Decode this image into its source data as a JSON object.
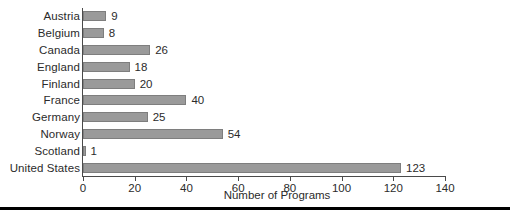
{
  "chart_data": {
    "type": "bar",
    "orientation": "horizontal",
    "title": "",
    "subtitle": "",
    "xlabel": "Number of Programs",
    "ylabel": "",
    "categories": [
      "Austria",
      "Belgium",
      "Canada",
      "England",
      "Finland",
      "France",
      "Germany",
      "Norway",
      "Scotland",
      "United States"
    ],
    "values": [
      9,
      8,
      26,
      18,
      20,
      40,
      25,
      54,
      1,
      123
    ],
    "value_labels": [
      "9",
      "8",
      "26",
      "18",
      "20",
      "40",
      "25",
      "54",
      "1",
      "123"
    ],
    "xlim": [
      0,
      140
    ],
    "xticks": [
      0,
      20,
      40,
      60,
      80,
      100,
      120,
      140
    ],
    "xtick_labels": [
      "0",
      "20",
      "40",
      "60",
      "80",
      "100",
      "120",
      "140"
    ],
    "grid": false,
    "legend": null,
    "legend_position": "none",
    "bar_color": "#9a9a9a",
    "bar_edge_color": "#7e7e7e",
    "axis_color": "#4a4a4a",
    "text_color": "#2b2b2b",
    "rule_color": "#000000"
  }
}
